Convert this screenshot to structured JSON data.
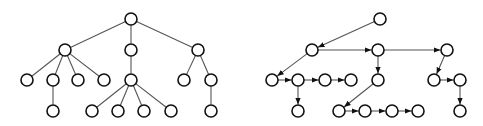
{
  "diagram": {
    "node_radius": 6,
    "colors": {
      "edge": "#555555",
      "node_stroke": "#111111",
      "node_fill": "#ffffff"
    },
    "trees": [
      {
        "name": "undirected-tree",
        "directed": false,
        "nodes": [
          {
            "id": "r",
            "x": 131,
            "y": 19
          },
          {
            "id": "a",
            "x": 65,
            "y": 50
          },
          {
            "id": "b",
            "x": 131,
            "y": 50
          },
          {
            "id": "c",
            "x": 198,
            "y": 50
          },
          {
            "id": "a1",
            "x": 27,
            "y": 80
          },
          {
            "id": "a2",
            "x": 53,
            "y": 80
          },
          {
            "id": "a3",
            "x": 78,
            "y": 80
          },
          {
            "id": "a4",
            "x": 104,
            "y": 80
          },
          {
            "id": "b1",
            "x": 131,
            "y": 80
          },
          {
            "id": "c1",
            "x": 184,
            "y": 80
          },
          {
            "id": "c2",
            "x": 211,
            "y": 80
          },
          {
            "id": "a2a",
            "x": 53,
            "y": 111
          },
          {
            "id": "b1a",
            "x": 92,
            "y": 111
          },
          {
            "id": "b1b",
            "x": 118,
            "y": 111
          },
          {
            "id": "b1c",
            "x": 144,
            "y": 111
          },
          {
            "id": "b1d",
            "x": 171,
            "y": 111
          },
          {
            "id": "c2a",
            "x": 211,
            "y": 111
          }
        ],
        "edges": [
          [
            "r",
            "a"
          ],
          [
            "r",
            "b"
          ],
          [
            "r",
            "c"
          ],
          [
            "a",
            "a1"
          ],
          [
            "a",
            "a2"
          ],
          [
            "a",
            "a3"
          ],
          [
            "a",
            "a4"
          ],
          [
            "b",
            "b1"
          ],
          [
            "c",
            "c1"
          ],
          [
            "c",
            "c2"
          ],
          [
            "a2",
            "a2a"
          ],
          [
            "b1",
            "b1a"
          ],
          [
            "b1",
            "b1b"
          ],
          [
            "b1",
            "b1c"
          ],
          [
            "b1",
            "b1d"
          ],
          [
            "c2",
            "c2a"
          ]
        ]
      },
      {
        "name": "directed-binary-representation",
        "directed": true,
        "nodes": [
          {
            "id": "r",
            "x": 380,
            "y": 19
          },
          {
            "id": "a",
            "x": 312,
            "y": 50
          },
          {
            "id": "b",
            "x": 378,
            "y": 50
          },
          {
            "id": "c",
            "x": 447,
            "y": 50
          },
          {
            "id": "a1",
            "x": 272,
            "y": 80
          },
          {
            "id": "a2",
            "x": 298,
            "y": 80
          },
          {
            "id": "a3",
            "x": 325,
            "y": 80
          },
          {
            "id": "a4",
            "x": 351,
            "y": 80
          },
          {
            "id": "b1",
            "x": 378,
            "y": 80
          },
          {
            "id": "c1",
            "x": 434,
            "y": 80
          },
          {
            "id": "c2",
            "x": 460,
            "y": 80
          },
          {
            "id": "a2a",
            "x": 298,
            "y": 111
          },
          {
            "id": "b1a",
            "x": 339,
            "y": 111
          },
          {
            "id": "b1b",
            "x": 365,
            "y": 111
          },
          {
            "id": "b1c",
            "x": 392,
            "y": 111
          },
          {
            "id": "b1d",
            "x": 418,
            "y": 111
          },
          {
            "id": "c2a",
            "x": 460,
            "y": 111
          }
        ],
        "edges": [
          [
            "r",
            "a"
          ],
          [
            "a",
            "b"
          ],
          [
            "b",
            "c"
          ],
          [
            "a",
            "a1"
          ],
          [
            "a1",
            "a2"
          ],
          [
            "a2",
            "a3"
          ],
          [
            "a3",
            "a4"
          ],
          [
            "a2",
            "a2a"
          ],
          [
            "b",
            "b1"
          ],
          [
            "b1",
            "b1a"
          ],
          [
            "b1a",
            "b1b"
          ],
          [
            "b1b",
            "b1c"
          ],
          [
            "b1c",
            "b1d"
          ],
          [
            "c",
            "c1"
          ],
          [
            "c1",
            "c2"
          ],
          [
            "c2",
            "c2a"
          ]
        ]
      }
    ]
  }
}
